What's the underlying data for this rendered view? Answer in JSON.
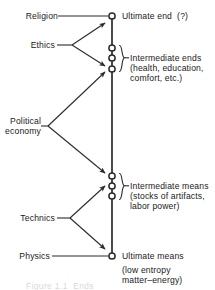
{
  "figure": {
    "type": "hierarchy-diagram",
    "axis": {
      "orientation": "vertical",
      "top_label": "Ultimate end  (?)",
      "bottom_label": "Ultimate means"
    },
    "colors": {
      "ink": "#1a1a1a",
      "line": "#2b2b2b",
      "background": "#ffffff",
      "ghost_caption": "#d8d8d8"
    }
  },
  "left_labels": [
    {
      "id": "religion",
      "text": "Religion"
    },
    {
      "id": "ethics",
      "text": "Ethics"
    },
    {
      "id": "political-economy",
      "text": "Political\neconomy"
    },
    {
      "id": "technics",
      "text": "Technics"
    },
    {
      "id": "physics",
      "text": "Physics"
    }
  ],
  "right_labels": [
    {
      "id": "ultimate-end",
      "heading": "Ultimate end  (?)",
      "detail": ""
    },
    {
      "id": "intermediate-ends",
      "heading": "Intermediate ends",
      "detail": "(health, education,\ncomfort, etc.)"
    },
    {
      "id": "intermediate-means",
      "heading": "Intermediate means",
      "detail": "(stocks of artifacts,\nlabor power)"
    },
    {
      "id": "ultimate-means",
      "heading": "Ultimate means",
      "detail": "(low entropy\nmatter–energy)"
    }
  ],
  "nodes": [
    {
      "id": "node-ultimate-end",
      "group": "ultimate-end"
    },
    {
      "id": "node-int-end-1",
      "group": "intermediate-ends"
    },
    {
      "id": "node-int-end-2",
      "group": "intermediate-ends"
    },
    {
      "id": "node-int-end-3",
      "group": "intermediate-ends"
    },
    {
      "id": "node-int-means-1",
      "group": "intermediate-means"
    },
    {
      "id": "node-int-means-2",
      "group": "intermediate-means"
    },
    {
      "id": "node-int-means-3",
      "group": "intermediate-means"
    },
    {
      "id": "node-ultimate-means",
      "group": "ultimate-means"
    }
  ],
  "connectors": [
    {
      "from": "religion",
      "to": "node-ultimate-end",
      "style": "plain"
    },
    {
      "from": "ethics",
      "to": "node-ultimate-end",
      "style": "arrow"
    },
    {
      "from": "ethics",
      "to": "node-int-end-3",
      "style": "arrow"
    },
    {
      "from": "political-economy",
      "to": "node-int-end-3",
      "style": "arrow"
    },
    {
      "from": "political-economy",
      "to": "node-int-means-1",
      "style": "arrow"
    },
    {
      "from": "technics",
      "to": "node-int-means-1",
      "style": "arrow"
    },
    {
      "from": "technics",
      "to": "node-ultimate-means",
      "style": "arrow"
    },
    {
      "from": "physics",
      "to": "node-ultimate-means",
      "style": "plain"
    }
  ],
  "ghost_caption": "Figure 1.1  Ends"
}
